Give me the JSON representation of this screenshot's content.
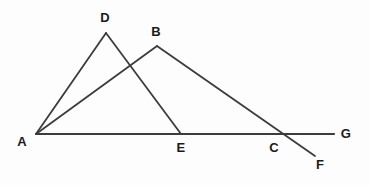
{
  "figure": {
    "kind": "geometry-line-diagram",
    "width": 369,
    "height": 185,
    "background_color": "#fdfdfd",
    "stroke_color": "#3c3c3c",
    "label_color": "#1a1a1a",
    "stroke_width": 1.8,
    "baseline_stroke_width": 2.2
  },
  "points": [
    {
      "id": "A",
      "label": "A",
      "x": 36,
      "y": 134,
      "label_x": 22,
      "label_y": 141
    },
    {
      "id": "D",
      "label": "D",
      "x": 106,
      "y": 33,
      "label_x": 105,
      "label_y": 17
    },
    {
      "id": "B",
      "label": "B",
      "x": 157,
      "y": 46,
      "label_x": 156,
      "label_y": 31
    },
    {
      "id": "E",
      "label": "E",
      "x": 181,
      "y": 134,
      "label_x": 181,
      "label_y": 147
    },
    {
      "id": "C",
      "label": "C",
      "x": 277,
      "y": 134,
      "label_x": 274,
      "label_y": 147
    },
    {
      "id": "G",
      "label": "G",
      "x": 334,
      "y": 134,
      "label_x": 346,
      "label_y": 133
    },
    {
      "id": "F",
      "label": "F",
      "x": 315,
      "y": 156,
      "label_x": 320,
      "label_y": 164
    }
  ],
  "segments": [
    {
      "id": "AG",
      "name": "baseline-segment-AG",
      "from": "A",
      "to": "G",
      "x1": 36,
      "y1": 134,
      "x2": 334,
      "y2": 134,
      "emphasis": "baseline"
    },
    {
      "id": "AD",
      "name": "segment-AD",
      "from": "A",
      "to": "D",
      "x1": 36,
      "y1": 134,
      "x2": 106,
      "y2": 33,
      "emphasis": "normal"
    },
    {
      "id": "DE",
      "name": "segment-DE",
      "from": "D",
      "to": "E",
      "x1": 106,
      "y1": 33,
      "x2": 181,
      "y2": 134,
      "emphasis": "normal"
    },
    {
      "id": "AB",
      "name": "segment-AB",
      "from": "A",
      "to": "B",
      "x1": 36,
      "y1": 134,
      "x2": 157,
      "y2": 46,
      "emphasis": "normal"
    },
    {
      "id": "BF",
      "name": "segment-BF",
      "from": "B",
      "to": "F",
      "x1": 157,
      "y1": 46,
      "x2": 315,
      "y2": 156,
      "emphasis": "normal"
    }
  ],
  "intersections": [
    {
      "id": "X1",
      "name": "crossing-AB-DE",
      "x": 130,
      "y": 65,
      "marked": false
    },
    {
      "id": "C",
      "name": "crossing-BF-AG",
      "x": 277,
      "y": 134,
      "marked": true
    }
  ]
}
